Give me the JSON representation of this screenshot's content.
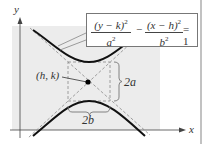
{
  "diagram": {
    "type": "hyperbola-vertical-transverse-axis",
    "axes": {
      "x_label": "x",
      "y_label": "y"
    },
    "equation": {
      "term1_numerator": "(y − k)",
      "term1_denominator": "a",
      "term2_numerator": "(x − h)",
      "term2_denominator": "b",
      "exponent": "2",
      "operator": "−",
      "rhs": "= 1"
    },
    "center_label": "(h, k)",
    "transverse_label": "2a",
    "conjugate_label": "2b",
    "colors": {
      "curve": "#111111",
      "dashed": "#8a8a8a",
      "shade": "#ececec",
      "axis": "#444444",
      "text": "#333333"
    }
  }
}
